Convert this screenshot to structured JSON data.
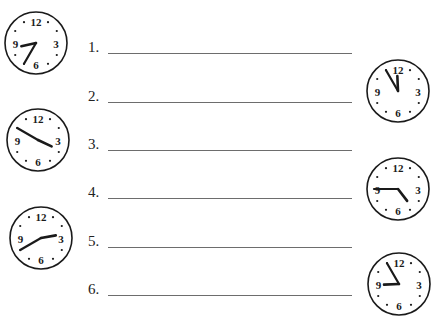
{
  "worksheet": {
    "answer_rows": [
      {
        "label": "1.",
        "y": 37
      },
      {
        "label": "2.",
        "y": 86
      },
      {
        "label": "3.",
        "y": 134
      },
      {
        "label": "4.",
        "y": 182
      },
      {
        "label": "5.",
        "y": 231
      },
      {
        "label": "6.",
        "y": 279
      }
    ],
    "clock_face_numbers": [
      "12",
      "3",
      "6",
      "9"
    ],
    "clocks": [
      {
        "id": "clock-1",
        "side": "left",
        "cx": 36,
        "cy": 43,
        "time": "8:35",
        "hour": 8,
        "minute": 35
      },
      {
        "id": "clock-2",
        "side": "left",
        "cx": 38,
        "cy": 140,
        "time": "3:50",
        "hour": 3,
        "minute": 50
      },
      {
        "id": "clock-3",
        "side": "left",
        "cx": 41,
        "cy": 238,
        "time": "2:40",
        "hour": 2,
        "minute": 40
      },
      {
        "id": "clock-4",
        "side": "right",
        "cx": 398,
        "cy": 91,
        "time": "11:55",
        "hour": 11,
        "minute": 55
      },
      {
        "id": "clock-5",
        "side": "right",
        "cx": 398,
        "cy": 189,
        "time": "4:45",
        "hour": 4,
        "minute": 45
      },
      {
        "id": "clock-6",
        "side": "right",
        "cx": 399,
        "cy": 284,
        "time": "8:55",
        "hour": 8,
        "minute": 55
      }
    ],
    "colors": {
      "ink": "#1a1a1a",
      "line": "#6d6d6d",
      "background": "#ffffff"
    }
  }
}
